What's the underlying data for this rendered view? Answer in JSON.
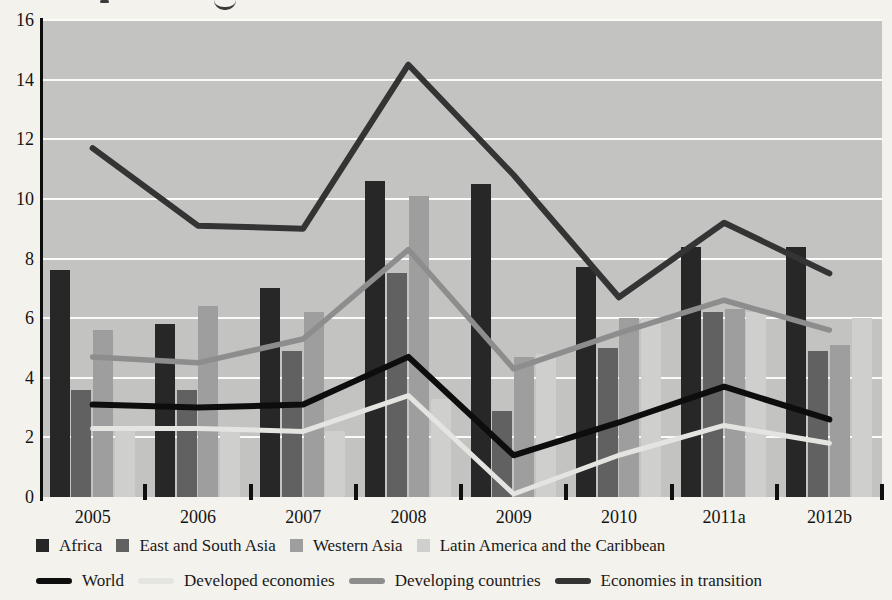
{
  "page": {
    "background": "#f4f2ed"
  },
  "chart_data": {
    "type": "bar+line",
    "categories": [
      "2005",
      "2006",
      "2007",
      "2008",
      "2009",
      "2010",
      "2011a",
      "2012b"
    ],
    "plot_bg": "#c3c3c1",
    "gridline_color": "#fbfbfa",
    "ylim": [
      0,
      16
    ],
    "ytick_step": 2,
    "ytick_labels": [
      "0",
      "2",
      "4",
      "6",
      "8",
      "10",
      "12",
      "14",
      "16"
    ],
    "grid": "horizontal white gridlines on gray plot background",
    "legend_position": "bottom, two rows",
    "bar_series": [
      {
        "name": "Africa",
        "color": "#272727",
        "values": [
          7.6,
          5.8,
          7.0,
          10.6,
          10.5,
          7.7,
          8.4,
          8.4
        ]
      },
      {
        "name": "East and South Asia",
        "color": "#616161",
        "values": [
          3.6,
          3.6,
          4.9,
          7.5,
          2.9,
          5.0,
          6.2,
          4.9
        ]
      },
      {
        "name": "Western Asia",
        "color": "#9e9e9e",
        "values": [
          5.6,
          6.4,
          6.2,
          10.1,
          4.7,
          6.0,
          6.3,
          5.1
        ]
      },
      {
        "name": "Latin America and the Caribbean",
        "color": "#cfcfcd",
        "values": [
          2.3,
          2.2,
          2.2,
          3.3,
          4.8,
          6.0,
          6.2,
          6.0
        ]
      }
    ],
    "line_series": [
      {
        "name": "World",
        "color": "#0d0d0d",
        "width": 6,
        "values": [
          3.1,
          3.0,
          3.1,
          4.7,
          1.4,
          2.5,
          3.7,
          2.6
        ]
      },
      {
        "name": "Developed economies",
        "color": "#e4e4e1",
        "width": 5,
        "values": [
          2.3,
          2.3,
          2.2,
          3.4,
          0.1,
          1.4,
          2.4,
          1.8
        ]
      },
      {
        "name": "Developing countries",
        "color": "#8d8d8d",
        "width": 5.5,
        "values": [
          4.7,
          4.5,
          5.3,
          8.3,
          4.3,
          5.5,
          6.6,
          5.6
        ]
      },
      {
        "name": "Economies in transition",
        "color": "#343434",
        "width": 6,
        "values": [
          11.7,
          9.1,
          9.0,
          14.5,
          10.8,
          6.7,
          9.2,
          7.5
        ]
      }
    ]
  }
}
